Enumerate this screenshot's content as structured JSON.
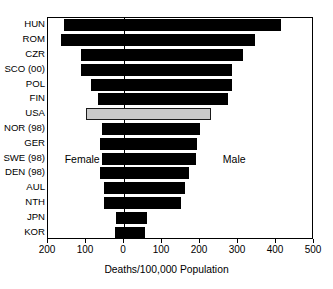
{
  "chart_data": {
    "type": "bar",
    "orientation": "horizontal",
    "subtype": "diverging-population-pyramid",
    "title": "",
    "xlabel": "Deaths/100,000 Population",
    "ylabel": "",
    "xlim": [
      -200,
      500
    ],
    "xticks": [
      -200,
      -100,
      0,
      100,
      200,
      300,
      400,
      500
    ],
    "xticklabels": [
      "200",
      "100",
      "0",
      "100",
      "200",
      "300",
      "400",
      "500"
    ],
    "grid": false,
    "legend": "none",
    "annotations": [
      {
        "text": "Female",
        "x": -110,
        "y": "SWE (98)"
      },
      {
        "text": "Male",
        "x": 290,
        "y": "SWE (98)"
      }
    ],
    "categories": [
      "HUN",
      "ROM",
      "CZR",
      "SCO (00)",
      "POL",
      "FIN",
      "USA",
      "NOR (98)",
      "GER",
      "SWE (98)",
      "DEN (98)",
      "AUL",
      "NTH",
      "JPN",
      "KOR"
    ],
    "series": [
      {
        "name": "Female",
        "note": "plotted leftward from zero; values are magnitudes",
        "values": [
          158,
          165,
          113,
          113,
          88,
          68,
          99,
          57,
          62,
          57,
          63,
          52,
          52,
          21,
          23
        ]
      },
      {
        "name": "Male",
        "note": "plotted rightward from zero",
        "values": [
          413,
          345,
          312,
          283,
          285,
          273,
          229,
          200,
          192,
          190,
          172,
          161,
          151,
          60,
          55
        ]
      }
    ],
    "highlight": {
      "category": "USA",
      "color": "#c9c9c9",
      "border_color": "#1a1a1a"
    },
    "bar_color": "#000000",
    "frame_color": "#000000",
    "background": "#ffffff"
  },
  "axis": {
    "x_title": "Deaths/100,000 Population",
    "tick_labels": [
      "200",
      "100",
      "0",
      "100",
      "200",
      "300",
      "400",
      "500"
    ]
  },
  "annotations": {
    "female": "Female",
    "male": "Male"
  }
}
